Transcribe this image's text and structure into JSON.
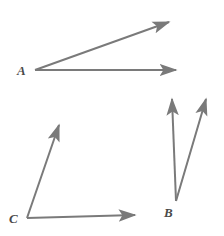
{
  "figure": {
    "name": "three-angles-diagram",
    "background_color": "#ffffff",
    "stroke_color": "#7a7a7a",
    "label_color": "#4a4a4a",
    "width": 224,
    "height": 236
  },
  "labels": {
    "a": "A",
    "b": "B",
    "c": "C"
  },
  "angles": [
    {
      "id": "angle-a",
      "label": "A",
      "vertex": {
        "x": 35,
        "y": 70
      },
      "rays": [
        {
          "id": "ray-a-horizontal",
          "to": {
            "x": 176,
            "y": 70
          },
          "arrow": true
        },
        {
          "id": "ray-a-upper",
          "to": {
            "x": 169,
            "y": 22
          },
          "arrow": true
        }
      ]
    },
    {
      "id": "angle-b",
      "label": "B",
      "vertex": {
        "x": 176,
        "y": 201
      },
      "rays": [
        {
          "id": "ray-b-vertical",
          "to": {
            "x": 172,
            "y": 99
          },
          "arrow": true
        },
        {
          "id": "ray-b-slanted",
          "to": {
            "x": 206,
            "y": 99
          },
          "arrow": true
        }
      ]
    },
    {
      "id": "angle-c",
      "label": "C",
      "vertex": {
        "x": 27,
        "y": 218
      },
      "rays": [
        {
          "id": "ray-c-horizontal",
          "to": {
            "x": 135,
            "y": 215
          },
          "arrow": true
        },
        {
          "id": "ray-c-upper",
          "to": {
            "x": 59,
            "y": 125
          },
          "arrow": true
        }
      ]
    }
  ]
}
